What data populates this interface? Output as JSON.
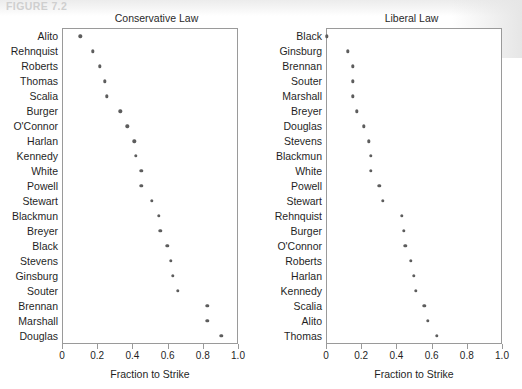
{
  "figure": {
    "caption": "FIGURE 7.2"
  },
  "chart_data": [
    {
      "type": "scatter",
      "title": "Conservative Law",
      "xlabel": "Fraction to Strike",
      "ylabel": "",
      "xlim": [
        0,
        1.0
      ],
      "xticks": [
        0,
        0.2,
        0.4,
        0.6,
        0.8,
        1.0
      ],
      "xticklabels": [
        "0",
        "0.2",
        "0.4",
        "0.6",
        "0.8",
        "1.0"
      ],
      "grid": false,
      "legend": false,
      "categories": [
        "Alito",
        "Rehnquist",
        "Roberts",
        "Thomas",
        "Scalia",
        "Burger",
        "O'Connor",
        "Harlan",
        "Kennedy",
        "White",
        "Powell",
        "Stewart",
        "Blackmun",
        "Breyer",
        "Black",
        "Stevens",
        "Ginsburg",
        "Souter",
        "Brennan",
        "Marshall",
        "Douglas"
      ],
      "values": [
        0.1,
        0.17,
        0.21,
        0.24,
        0.25,
        0.33,
        0.37,
        0.41,
        0.42,
        0.45,
        0.45,
        0.51,
        0.55,
        0.56,
        0.6,
        0.62,
        0.63,
        0.66,
        0.83,
        0.83,
        0.91
      ]
    },
    {
      "type": "scatter",
      "title": "Liberal Law",
      "xlabel": "Fraction to Strike",
      "ylabel": "",
      "xlim": [
        0,
        1.0
      ],
      "xticks": [
        0,
        0.2,
        0.4,
        0.6,
        0.8,
        1.0
      ],
      "xticklabels": [
        "0",
        "0.2",
        "0.4",
        "0.6",
        "0.8",
        "1.0"
      ],
      "grid": false,
      "legend": false,
      "categories": [
        "Black",
        "Ginsburg",
        "Brennan",
        "Souter",
        "Marshall",
        "Breyer",
        "Douglas",
        "Stevens",
        "Blackmun",
        "White",
        "Powell",
        "Stewart",
        "Rehnquist",
        "Burger",
        "O'Connor",
        "Roberts",
        "Harlan",
        "Kennedy",
        "Scalia",
        "Alito",
        "Thomas"
      ],
      "values": [
        0.0,
        0.12,
        0.15,
        0.15,
        0.15,
        0.17,
        0.21,
        0.24,
        0.25,
        0.25,
        0.3,
        0.32,
        0.43,
        0.44,
        0.45,
        0.48,
        0.5,
        0.51,
        0.56,
        0.58,
        0.63
      ]
    }
  ],
  "panels": {
    "left": {
      "title": "Conservative Law",
      "xaxis_title": "Fraction to Strike",
      "tick_0": "0",
      "tick_1": "0.2",
      "tick_2": "0.4",
      "tick_3": "0.6",
      "tick_4": "0.8",
      "tick_5": "1.0"
    },
    "right": {
      "title": "Liberal Law",
      "xaxis_title": "Fraction to Strike",
      "tick_0": "0",
      "tick_1": "0.2",
      "tick_2": "0.4",
      "tick_3": "0.6",
      "tick_4": "0.8",
      "tick_5": "1.0"
    }
  },
  "style": {
    "dot_color": "#5d5d5d",
    "frame_color": "#9a9a9a",
    "text_color": "#1f1f1f"
  }
}
